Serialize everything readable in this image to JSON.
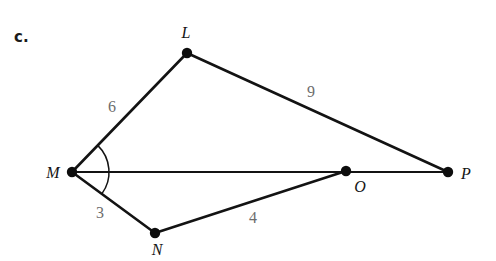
{
  "figure": {
    "problem_label": "c.",
    "stroke_color": "#131313",
    "vertex_color": "#0d0d0d",
    "edge_label_color": "#6d6d6d",
    "background_color": "#ffffff",
    "vertices": [
      {
        "name": "L",
        "label": "L",
        "x": 187,
        "y": 53,
        "label_x": 186,
        "label_y": 33
      },
      {
        "name": "M",
        "label": "M",
        "x": 72,
        "y": 172,
        "label_x": 53,
        "label_y": 173
      },
      {
        "name": "N",
        "label": "N",
        "x": 155,
        "y": 233,
        "label_x": 157,
        "label_y": 250
      },
      {
        "name": "O",
        "label": "O",
        "x": 346,
        "y": 171,
        "label_x": 360,
        "label_y": 187
      },
      {
        "name": "P",
        "label": "P",
        "x": 448,
        "y": 172,
        "label_x": 466,
        "label_y": 174
      }
    ],
    "segments": [
      {
        "name": "segment-ML",
        "from": "M",
        "to": "L",
        "label": "6",
        "label_x": 112,
        "label_y": 107
      },
      {
        "name": "segment-LP",
        "from": "L",
        "to": "P",
        "label": "9",
        "label_x": 311,
        "label_y": 92
      },
      {
        "name": "segment-MN",
        "from": "M",
        "to": "N",
        "label": "3",
        "label_x": 100,
        "label_y": 213
      },
      {
        "name": "segment-NO",
        "from": "N",
        "to": "O",
        "label": "4",
        "label_x": 253,
        "label_y": 218
      },
      {
        "name": "segment-MP",
        "from": "M",
        "to": "P",
        "label": "",
        "label_x": 0,
        "label_y": 0
      }
    ],
    "angle_arc": {
      "name": "angle-arc-LMN",
      "vertex": "M",
      "from_vertex": "L",
      "to_vertex": "N",
      "radius": 37
    }
  }
}
